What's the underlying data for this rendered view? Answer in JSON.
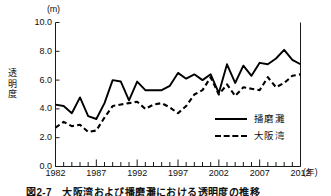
{
  "figure": {
    "unit_label": "(m)",
    "y_axis_title": "透\n明\n度",
    "x_axis_unit": "(年)",
    "caption": "図2-7　大阪湾および播磨灘における透明度の推移"
  },
  "legend": {
    "position": "inside-bottom-right",
    "entries": [
      {
        "label": "播磨灘",
        "style": "solid"
      },
      {
        "label": "大阪湾",
        "style": "dashed"
      }
    ]
  },
  "colors": {
    "line": "#000000",
    "axis": "#1a1a1a",
    "background": "#ffffff"
  },
  "chart_data": {
    "type": "line",
    "title": "",
    "xlabel": "年",
    "ylabel": "透明度",
    "yunit": "m",
    "ylim": [
      0.0,
      10.0
    ],
    "ytick_labels": [
      "0.0",
      "2.0",
      "4.0",
      "6.0",
      "8.0",
      "10.0"
    ],
    "ytick_values": [
      0.0,
      2.0,
      4.0,
      6.0,
      8.0,
      10.0
    ],
    "xlim": [
      1982,
      2012
    ],
    "xtick_labels": [
      "1982",
      "1987",
      "1992",
      "1997",
      "2002",
      "2007",
      "2012"
    ],
    "xtick_values": [
      1982,
      1987,
      1992,
      1997,
      2002,
      2007,
      2012
    ],
    "minor_x_ticks_every": 1,
    "grid": false,
    "x": [
      1982,
      1983,
      1984,
      1985,
      1986,
      1987,
      1988,
      1989,
      1990,
      1991,
      1992,
      1993,
      1994,
      1995,
      1996,
      1997,
      1998,
      1999,
      2000,
      2001,
      2002,
      2003,
      2004,
      2005,
      2006,
      2007,
      2008,
      2009,
      2010,
      2011,
      2012
    ],
    "series": [
      {
        "name": "播磨灘",
        "style": "solid",
        "values": [
          4.3,
          4.2,
          3.7,
          4.8,
          3.5,
          3.3,
          4.4,
          6.0,
          5.9,
          4.6,
          5.9,
          5.3,
          5.3,
          5.3,
          5.6,
          6.5,
          6.1,
          6.4,
          6.0,
          6.4,
          5.1,
          7.1,
          5.8,
          7.0,
          6.3,
          7.2,
          7.1,
          7.5,
          8.1,
          7.4,
          7.1
        ]
      },
      {
        "name": "大阪湾",
        "style": "dashed",
        "values": [
          2.7,
          3.1,
          2.8,
          2.9,
          2.4,
          2.5,
          3.4,
          4.2,
          4.3,
          4.4,
          4.5,
          4.0,
          4.3,
          4.4,
          4.1,
          3.7,
          4.2,
          5.0,
          5.3,
          6.2,
          5.0,
          5.7,
          4.9,
          5.5,
          5.4,
          5.3,
          6.2,
          5.5,
          5.8,
          6.3,
          6.4
        ]
      }
    ]
  }
}
